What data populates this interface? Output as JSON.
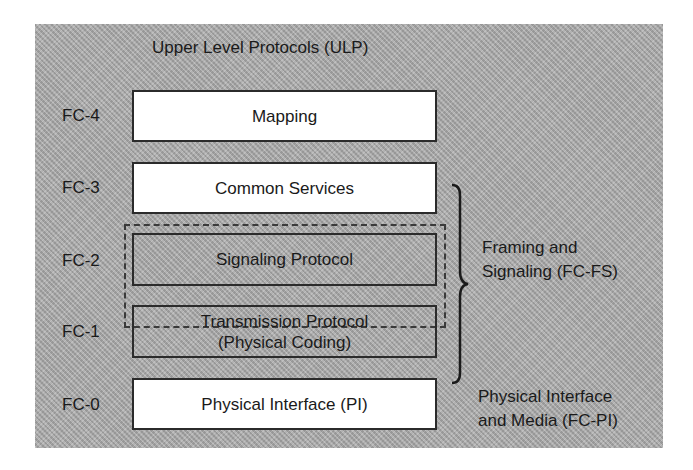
{
  "diagram": {
    "title": "Upper Level Protocols (ULP)",
    "layers": [
      {
        "level": "FC-4",
        "label": "Mapping"
      },
      {
        "level": "FC-3",
        "label": "Common Services"
      },
      {
        "level": "FC-2",
        "label": "Signaling Protocol"
      },
      {
        "level": "FC-1",
        "label_line1": "Transmission Protocol",
        "label_line2": "(Physical Coding)"
      },
      {
        "level": "FC-0",
        "label": "Physical Interface (PI)"
      }
    ],
    "groups": {
      "framing": {
        "line1": "Framing and",
        "line2": "Signaling (FC-FS)"
      },
      "physical": {
        "line1": "Physical Interface",
        "line2": "and Media (FC-PI)"
      }
    }
  }
}
